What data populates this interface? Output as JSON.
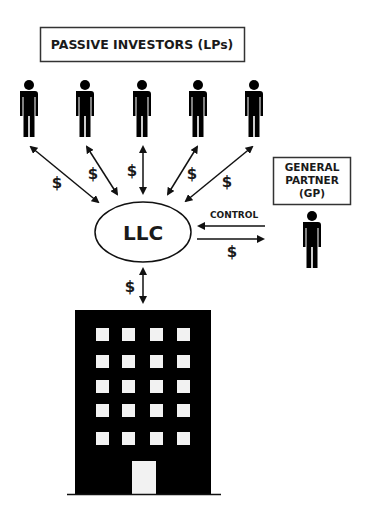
{
  "diagram": {
    "lp_box": {
      "label": "PASSIVE INVESTORS (LPs)"
    },
    "gp_box": {
      "lines": [
        "GENERAL",
        "PARTNER",
        "(GP)"
      ]
    },
    "entity": {
      "label": "LLC"
    },
    "flows": {
      "lp_money_label": "$",
      "control_label": "CONTROL",
      "gp_money_label": "$",
      "property_money_label": "$"
    },
    "investors_count": 5,
    "icons": {
      "investor": "person-icon",
      "gp": "person-icon",
      "property": "building-icon"
    },
    "colors": {
      "ink": "#000000",
      "text": "#1a1a1a",
      "background": "#ffffff",
      "window": "#f2f2f2"
    }
  }
}
